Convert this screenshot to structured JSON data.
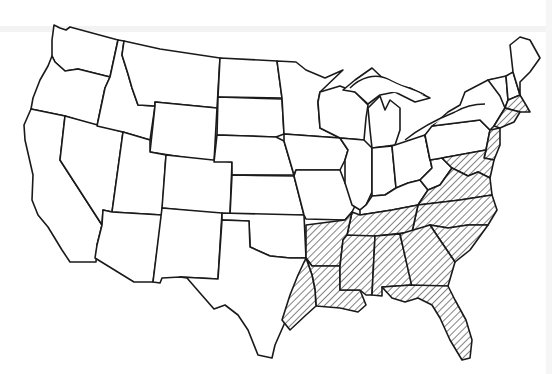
{
  "map": {
    "subject": "Contiguous United States outline map",
    "style": "black line art on white, scanned",
    "colors": {
      "background": "#ffffff",
      "outline": "#1a1a1a",
      "hatch": "#1a1a1a"
    },
    "legend": null,
    "labels": [],
    "highlighted_region": {
      "pattern": "diagonal-hatch",
      "states": [
        "Texas-east (partial)",
        "Arkansas",
        "Louisiana",
        "Mississippi",
        "Alabama",
        "Georgia",
        "Florida",
        "Tennessee",
        "South Carolina",
        "North Carolina",
        "Virginia",
        "Maryland",
        "Delaware",
        "New Jersey",
        "Connecticut",
        "Rhode Island",
        "Massachusetts"
      ]
    },
    "states_unhatched": [
      "Washington",
      "Oregon",
      "California",
      "Idaho",
      "Nevada",
      "Montana",
      "Wyoming",
      "Utah",
      "Arizona",
      "Colorado",
      "New Mexico",
      "North Dakota",
      "South Dakota",
      "Nebraska",
      "Kansas",
      "Oklahoma",
      "Texas",
      "Minnesota",
      "Iowa",
      "Missouri",
      "Wisconsin",
      "Illinois",
      "Michigan",
      "Indiana",
      "Ohio",
      "Kentucky",
      "West Virginia",
      "Pennsylvania",
      "New York",
      "Vermont",
      "New Hampshire",
      "Maine"
    ]
  }
}
